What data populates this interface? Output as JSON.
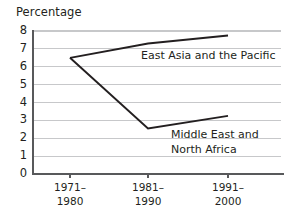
{
  "chart_data": {
    "type": "line",
    "title": "Percentage",
    "xlabel": "",
    "ylabel": "",
    "ylim": [
      0,
      8
    ],
    "yticks": [
      0,
      1,
      2,
      3,
      4,
      5,
      6,
      7,
      8
    ],
    "ytick_labels": [
      "0",
      "1",
      "2",
      "3",
      "4",
      "5",
      "6",
      "7",
      "8"
    ],
    "grid": true,
    "grid_axis": "y",
    "legend_position": "inline-annotation",
    "categories": [
      "1971–1980",
      "1981–1990",
      "1991–2000"
    ],
    "xtick_labels": [
      [
        "1971–",
        "1980"
      ],
      [
        "1981–",
        "1990"
      ],
      [
        "1991–",
        "2000"
      ]
    ],
    "series": [
      {
        "name": "East Asia and the Pacific",
        "label_lines": [
          "East Asia and the Pacific"
        ],
        "values": [
          6.5,
          7.3,
          7.75
        ]
      },
      {
        "name": "Middle East and North Africa",
        "label_lines": [
          "Middle East and",
          "North Africa"
        ],
        "values": [
          6.5,
          2.55,
          3.25
        ]
      }
    ],
    "colors": {
      "line": "#231f20",
      "axis": "#58595b",
      "grid": "#c7c8ca",
      "background": "#ffffff",
      "text": "#231f20"
    }
  }
}
